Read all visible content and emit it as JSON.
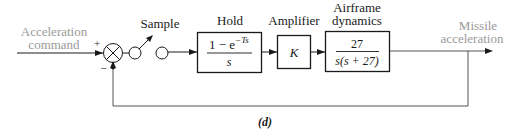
{
  "diagram": {
    "caption": "(d)",
    "input": {
      "line1": "Acceleration",
      "line2": "command"
    },
    "output": {
      "line1": "Missile",
      "line2": "acceleration"
    },
    "summing_junction": {
      "plus_sign": "+",
      "minus_sign": "−"
    },
    "sampler": {
      "label": "Sample"
    },
    "blocks": [
      {
        "id": "hold",
        "label": "Hold",
        "numerator": "1 − e",
        "exponent": "−Ts",
        "denominator": "s"
      },
      {
        "id": "amplifier",
        "label": "Amplifier",
        "content": "K"
      },
      {
        "id": "airframe",
        "label_line1": "Airframe",
        "label_line2": "dynamics",
        "numerator": "27",
        "denominator": "s(s + 27)"
      }
    ],
    "colors": {
      "line": "#1a1a1a",
      "signal_label": "#9a9a9a",
      "feedback_line": "#555555"
    }
  }
}
